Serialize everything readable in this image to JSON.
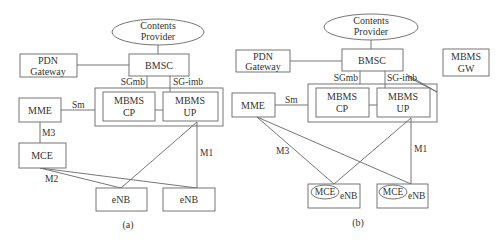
{
  "diagram_a": {
    "caption": "(a)",
    "nodes": {
      "contents_provider": [
        "Contents",
        "Provider"
      ],
      "pdn_gateway": [
        "PDN",
        "Gateway"
      ],
      "bmsc": "BMSC",
      "mme": "MME",
      "mbms_cp": [
        "MBMS",
        "CP"
      ],
      "mbms_up": [
        "MBMS",
        "UP"
      ],
      "mce": "MCE",
      "enb1": "eNB",
      "enb2": "eNB"
    },
    "interfaces": {
      "sgmb": "SGmb",
      "sgimb": "SG-imb",
      "sm": "Sm",
      "m3": "M3",
      "m2": "M2",
      "m1": "M1"
    }
  },
  "diagram_b": {
    "caption": "(b)",
    "nodes": {
      "contents_provider": [
        "Contents",
        "Provider"
      ],
      "pdn_gateway": [
        "PDN",
        "Gateway"
      ],
      "bmsc": "BMSC",
      "mbms_gw": [
        "MBMS",
        "GW"
      ],
      "mme": "MME",
      "mbms_cp": [
        "MBMS",
        "CP"
      ],
      "mbms_up": [
        "MBMS",
        "UP"
      ],
      "enb1_mce": "MCE",
      "enb1": "eNB",
      "enb2_mce": "MCE",
      "enb2": "eNB"
    },
    "interfaces": {
      "sgmb": "SGmb",
      "sgimb": "SG-imb",
      "sm": "Sm",
      "m3": "M3",
      "m1": "M1"
    }
  }
}
